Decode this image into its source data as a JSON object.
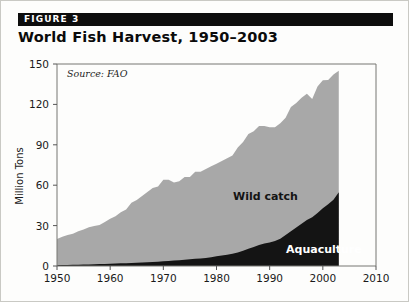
{
  "figure": {
    "banner_label": "FIGURE 3",
    "title": "World Fish Harvest, 1950–2003",
    "source_note": "Source: FAO"
  },
  "colors": {
    "banner_background": "#0d0d0d",
    "banner_text": "#ffffff",
    "wild_catch_fill": "#a8a8a8",
    "aquaculture_fill": "#141414",
    "axis_line": "#555555",
    "card_background": "#fdfdfc",
    "card_border": "#c9c9c4"
  },
  "chart_data": {
    "type": "area",
    "stacked": true,
    "title": "World Fish Harvest, 1950–2003",
    "subtitle": "",
    "xlabel": "",
    "ylabel": "Million Tons",
    "xlim": [
      1950,
      2010
    ],
    "ylim": [
      0,
      150
    ],
    "grid": false,
    "legend_position": "inline-annotation",
    "annotations": [
      "Source: FAO"
    ],
    "x_ticks": [
      1950,
      1960,
      1970,
      1980,
      1990,
      2000,
      2010
    ],
    "y_ticks": [
      0,
      30,
      60,
      90,
      120,
      150
    ],
    "x": [
      1950,
      1951,
      1952,
      1953,
      1954,
      1955,
      1956,
      1957,
      1958,
      1959,
      1960,
      1961,
      1962,
      1963,
      1964,
      1965,
      1966,
      1967,
      1968,
      1969,
      1970,
      1971,
      1972,
      1973,
      1974,
      1975,
      1976,
      1977,
      1978,
      1979,
      1980,
      1981,
      1982,
      1983,
      1984,
      1985,
      1986,
      1987,
      1988,
      1989,
      1990,
      1991,
      1992,
      1993,
      1994,
      1995,
      1996,
      1997,
      1998,
      1999,
      2000,
      2001,
      2002,
      2003
    ],
    "series": [
      {
        "name": "Aquaculture",
        "label": "Aquaculture",
        "color": "#141414",
        "values": [
          0.6,
          0.7,
          0.8,
          0.9,
          1.0,
          1.1,
          1.2,
          1.3,
          1.4,
          1.5,
          1.7,
          1.8,
          2.0,
          2.1,
          2.3,
          2.4,
          2.6,
          2.8,
          3.0,
          3.1,
          3.5,
          3.7,
          4.0,
          4.3,
          4.6,
          5.0,
          5.3,
          5.6,
          6.0,
          6.5,
          7.2,
          7.8,
          8.4,
          9.1,
          10.0,
          11.4,
          12.8,
          14.2,
          15.6,
          16.8,
          17.4,
          18.6,
          20.2,
          23.0,
          25.8,
          28.6,
          31.4,
          34.2,
          36.2,
          39.4,
          42.8,
          45.8,
          49.2,
          54.8
        ]
      },
      {
        "name": "Wild catch",
        "label": "Wild catch",
        "color": "#a8a8a8",
        "values": [
          19.4,
          21.0,
          22.2,
          23.0,
          24.8,
          26.0,
          27.6,
          28.4,
          29.0,
          31.2,
          33.3,
          35.2,
          38.0,
          39.9,
          44.7,
          46.6,
          49.4,
          52.2,
          55.0,
          55.9,
          60.5,
          60.3,
          58.0,
          58.7,
          61.4,
          61.0,
          64.7,
          64.4,
          66.0,
          67.5,
          68.8,
          70.2,
          71.6,
          72.9,
          78.0,
          80.6,
          85.2,
          85.8,
          88.4,
          87.2,
          85.6,
          84.4,
          85.8,
          87.0,
          92.2,
          92.4,
          93.6,
          93.8,
          87.8,
          93.8,
          95.2,
          92.4,
          93.0,
          90.2
        ]
      }
    ],
    "totals": [
      20.0,
      21.7,
      23.0,
      23.9,
      25.8,
      27.1,
      28.8,
      29.7,
      30.4,
      32.7,
      35.0,
      37.0,
      40.0,
      42.0,
      47.0,
      49.0,
      52.0,
      55.0,
      58.0,
      59.0,
      64.0,
      64.0,
      62.0,
      63.0,
      66.0,
      66.0,
      70.0,
      70.0,
      72.0,
      74.0,
      76.0,
      78.0,
      80.0,
      82.0,
      88.0,
      92.0,
      98.0,
      100.0,
      104.0,
      104.0,
      103.0,
      103.0,
      106.0,
      110.0,
      118.0,
      121.0,
      125.0,
      128.0,
      124.0,
      133.2,
      138.0,
      138.2,
      142.2,
      145.0
    ]
  }
}
